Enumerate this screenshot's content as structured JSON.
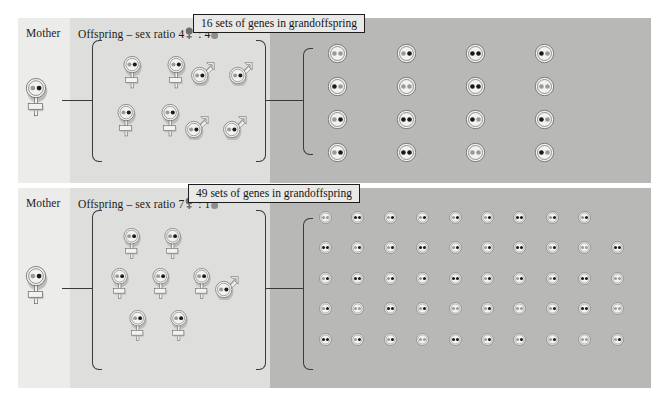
{
  "figure": {
    "title_top_box": "16 sets of genes in grandoffspring",
    "title_bottom_box": "49 sets of genes in grandoffspring"
  },
  "colors": {
    "panel_mother": "#ececeb",
    "panel_offspring": "#dededc",
    "panel_grand": "#b8b8b6",
    "gene_dark": "#1a1a1a",
    "gene_light": "#9a9a9a",
    "symbol_fill": "#f2f2f0",
    "symbol_shadow": "#b9b9b6",
    "outline": "#5a5a5a",
    "connector": "#3a3a3a",
    "box_border": "#1d1d1d",
    "box_fill": "#e9e9e7"
  },
  "rows": [
    {
      "id": "row-top",
      "mother_label": "Mother",
      "offspring_label_prefix": "Offspring – sex ratio ",
      "offspring_female_count": "4",
      "offspring_ratio_sep": " : ",
      "offspring_male_count": "4",
      "grand_label": "16 sets of genes in grandoffspring",
      "mother": {
        "sex": "female",
        "genes": [
          "light",
          "dark"
        ]
      },
      "offspring_females": [
        {
          "genes": [
            "light",
            "dark"
          ]
        },
        {
          "genes": [
            "light",
            "dark"
          ]
        },
        {
          "genes": [
            "light",
            "dark"
          ]
        },
        {
          "genes": [
            "light",
            "dark"
          ]
        }
      ],
      "offspring_males": [
        {
          "genes": [
            "light",
            "dark"
          ]
        },
        {
          "genes": [
            "light",
            "dark"
          ]
        },
        {
          "genes": [
            "light",
            "dark"
          ]
        },
        {
          "genes": [
            "light",
            "dark"
          ]
        }
      ],
      "grand_grid": {
        "columns": 4,
        "rows": 4,
        "total": 16,
        "cells": [
          [
            "light",
            "light"
          ],
          [
            "light",
            "dark"
          ],
          [
            "dark",
            "dark"
          ],
          [
            "dark",
            "light"
          ],
          [
            "dark",
            "light"
          ],
          [
            "light",
            "light"
          ],
          [
            "dark",
            "dark"
          ],
          [
            "light",
            "light"
          ],
          [
            "light",
            "dark"
          ],
          [
            "dark",
            "dark"
          ],
          [
            "dark",
            "light"
          ],
          [
            "dark",
            "light"
          ],
          [
            "light",
            "dark"
          ],
          [
            "dark",
            "dark"
          ],
          [
            "light",
            "light"
          ],
          [
            "dark",
            "light"
          ]
        ]
      }
    },
    {
      "id": "row-bottom",
      "mother_label": "Mother",
      "offspring_label_prefix": "Offspring – sex ratio ",
      "offspring_female_count": "7",
      "offspring_ratio_sep": " : ",
      "offspring_male_count": "1",
      "grand_label": "49 sets of genes in grandoffspring",
      "mother": {
        "sex": "female",
        "genes": [
          "light",
          "dark"
        ]
      },
      "offspring_females": [
        {
          "genes": [
            "light",
            "dark"
          ]
        },
        {
          "genes": [
            "light",
            "dark"
          ]
        },
        {
          "genes": [
            "light",
            "dark"
          ]
        },
        {
          "genes": [
            "light",
            "dark"
          ]
        },
        {
          "genes": [
            "light",
            "dark"
          ]
        },
        {
          "genes": [
            "light",
            "dark"
          ]
        },
        {
          "genes": [
            "light",
            "dark"
          ]
        }
      ],
      "offspring_males": [
        {
          "genes": [
            "light",
            "dark"
          ]
        }
      ],
      "grand_grid": {
        "columns": 10,
        "rows": 5,
        "total": 49,
        "cells": [
          [
            "light",
            "light"
          ],
          [
            "dark",
            "dark"
          ],
          [
            "light",
            "dark"
          ],
          [
            "light",
            "dark"
          ],
          [
            "light",
            "dark"
          ],
          [
            "light",
            "dark"
          ],
          [
            "dark",
            "dark"
          ],
          [
            "light",
            "dark"
          ],
          [
            "light",
            "dark"
          ],
          [
            "dark",
            "dark"
          ],
          [
            "light",
            "dark"
          ],
          [
            "light",
            "dark"
          ],
          [
            "dark",
            "dark"
          ],
          [
            "light",
            "dark"
          ],
          [
            "light",
            "dark"
          ],
          [
            "dark",
            "dark"
          ],
          [
            "light",
            "dark"
          ],
          [
            "light",
            "light"
          ],
          [
            "dark",
            "dark"
          ],
          [
            "light",
            "dark"
          ],
          [
            "dark",
            "dark"
          ],
          [
            "light",
            "dark"
          ],
          [
            "light",
            "dark"
          ],
          [
            "dark",
            "dark"
          ],
          [
            "light",
            "dark"
          ],
          [
            "light",
            "dark"
          ],
          [
            "light",
            "dark"
          ],
          [
            "dark",
            "dark"
          ],
          [
            "light",
            "light"
          ],
          [
            "light",
            "dark"
          ],
          [
            "light",
            "light"
          ],
          [
            "dark",
            "dark"
          ],
          [
            "light",
            "dark"
          ],
          [
            "light",
            "light"
          ],
          [
            "light",
            "dark"
          ],
          [
            "light",
            "light"
          ],
          [
            "light",
            "dark"
          ],
          [
            "dark",
            "dark"
          ],
          [
            "light",
            "light"
          ],
          [
            "dark",
            "dark"
          ],
          [
            "light",
            "dark"
          ],
          [
            "light",
            "dark"
          ],
          [
            "light",
            "light"
          ],
          [
            "dark",
            "dark"
          ],
          [
            "light",
            "dark"
          ],
          [
            "light",
            "dark"
          ],
          [
            "light",
            "dark"
          ],
          [
            "light",
            "light"
          ],
          [
            "light",
            "dark"
          ]
        ]
      }
    }
  ]
}
